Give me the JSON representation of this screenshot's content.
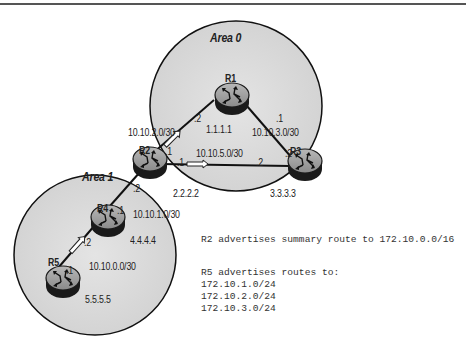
{
  "areas": [
    {
      "id": "area0",
      "label": "Area 0"
    },
    {
      "id": "area1",
      "label": "Area 1"
    }
  ],
  "routers": [
    {
      "id": "R1",
      "name": "R1",
      "router_id": "1.1.1.1"
    },
    {
      "id": "R2",
      "name": "R2",
      "router_id": "2.2.2.2"
    },
    {
      "id": "R3",
      "name": "R3",
      "router_id": "3.3.3.3"
    },
    {
      "id": "R4",
      "name": "R4",
      "router_id": "4.4.4.4"
    },
    {
      "id": "R5",
      "name": "R5",
      "router_id": "5.5.5.5"
    }
  ],
  "links": [
    {
      "from": "R2",
      "to": "R1",
      "network": "10.10.2.0/30",
      "from_if": ".1",
      "to_if": ".2"
    },
    {
      "from": "R1",
      "to": "R3",
      "network": "10.10.3.0/30",
      "from_if": ".1",
      "to_if": ".2"
    },
    {
      "from": "R2",
      "to": "R3",
      "network": "10.10.5.0/30",
      "from_if": ".1",
      "to_if": ".2"
    },
    {
      "from": "R4",
      "to": "R2",
      "network": "10.10.1.0/30",
      "from_if": ".1",
      "to_if": ".2"
    },
    {
      "from": "R5",
      "to": "R4",
      "network": "10.10.0.0/30",
      "from_if": ".1",
      "to_if": ".2"
    }
  ],
  "notes": {
    "summary": "R2 advertises summary route to 172.10.0.0/16",
    "r5_heading": "R5 advertises routes to:",
    "r5_routes": [
      "172.10.1.0/24",
      "172.10.2.0/24",
      "172.10.3.0/24"
    ]
  }
}
